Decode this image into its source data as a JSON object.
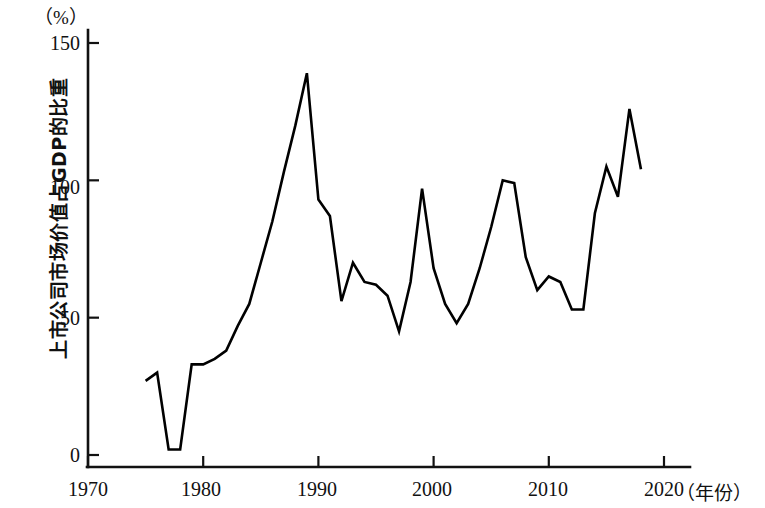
{
  "chart_data": {
    "type": "line",
    "title": "",
    "subtitle": "",
    "unit_label": "（%）",
    "ylabel": "上市公司市场价值占GDP的比重",
    "xlabel": "（年份）",
    "xlim": [
      1970,
      2020
    ],
    "ylim": [
      0,
      150
    ],
    "grid": false,
    "legend": null,
    "xticks": [
      "1970",
      "1980",
      "1990",
      "2000",
      "2010",
      "2020"
    ],
    "xtick_values": [
      1970,
      1980,
      1990,
      2000,
      2010,
      2020
    ],
    "yticks": [
      "0",
      "50",
      "100",
      "150"
    ],
    "ytick_values": [
      0,
      50,
      100,
      150
    ],
    "series": [
      {
        "name": "上市公司市场价值占GDP的比重",
        "color": "#000000",
        "x": [
          1975,
          1976,
          1977,
          1978,
          1979,
          1980,
          1981,
          1982,
          1983,
          1984,
          1985,
          1986,
          1987,
          1988,
          1989,
          1990,
          1991,
          1992,
          1993,
          1994,
          1995,
          1996,
          1997,
          1998,
          1999,
          2000,
          2001,
          2002,
          2003,
          2004,
          2005,
          2006,
          2007,
          2008,
          2009,
          2010,
          2011,
          2012,
          2013,
          2014,
          2015,
          2016,
          2017,
          2018
        ],
        "values": [
          27,
          30,
          2,
          2,
          33,
          33,
          35,
          38,
          47,
          55,
          70,
          85,
          103,
          120,
          139,
          93,
          87,
          56,
          70,
          63,
          62,
          58,
          45,
          63,
          97,
          68,
          55,
          48,
          55,
          68,
          83,
          100,
          99,
          72,
          60,
          65,
          63,
          53,
          53,
          88,
          105,
          94,
          126,
          104
        ]
      }
    ]
  }
}
